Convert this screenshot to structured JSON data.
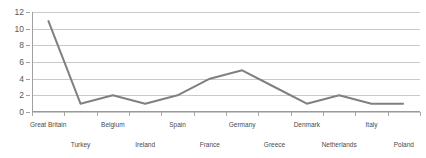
{
  "chart_data": {
    "type": "line",
    "title": "",
    "subtitle": "",
    "xlabel": "",
    "ylabel": "",
    "ylim": [
      0,
      12
    ],
    "y_ticks": [
      0,
      2,
      4,
      6,
      8,
      10,
      12
    ],
    "grid": true,
    "legend": "none",
    "line_color": "#808080",
    "gridline_color": "#c9c9c9",
    "axis_color": "#a0a0a0",
    "background_color": "#ffffff",
    "label_color": "#4a4a4a",
    "categories": [
      "Great Britain",
      "Turkey",
      "Belgium",
      "Ireland",
      "Spain",
      "France",
      "Germany",
      "Greece",
      "Denmark",
      "Netherlands",
      "Italy",
      "Poland"
    ],
    "category_label_rows": [
      "top",
      "bottom",
      "top",
      "bottom",
      "top",
      "bottom",
      "top",
      "bottom",
      "top",
      "bottom",
      "top",
      "bottom"
    ],
    "values": [
      11,
      1,
      2,
      1,
      2,
      4,
      5,
      3,
      1,
      2,
      1,
      1
    ]
  }
}
